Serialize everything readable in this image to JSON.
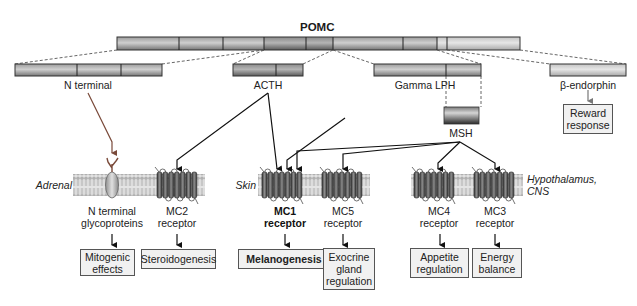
{
  "title": "POMC",
  "colors": {
    "bar_dark": "#6e6e6e",
    "bar_mid": "#9a9a9a",
    "bar_light": "#c9c9c9",
    "arrow_black": "#111111",
    "arrow_brown": "#7a4a3a",
    "membrane": "#c8c8c8",
    "receptor": "#5a5a5a",
    "box_fill": "#f1f1f1"
  },
  "pomc_bar": {
    "x_start": 117,
    "x_end": 520,
    "dividers": [
      179,
      223,
      264,
      306,
      333,
      403,
      437,
      447
    ]
  },
  "fragments": [
    {
      "id": "n-terminal",
      "label": "N terminal"
    },
    {
      "id": "acth",
      "label": "ACTH"
    },
    {
      "id": "gamma-lph",
      "label": "Gamma LPH"
    },
    {
      "id": "beta-endorphin",
      "label": "β-endorphin"
    },
    {
      "id": "msh",
      "label": "MSH"
    }
  ],
  "tissues": [
    {
      "id": "adrenal",
      "label": "Adrenal"
    },
    {
      "id": "skin",
      "label": "Skin"
    },
    {
      "id": "hypothalamus",
      "label": "Hypothalamus, CNS"
    }
  ],
  "receptors": [
    {
      "id": "n-terminal-glyco",
      "label": "N terminal glycoproteins",
      "bold": false
    },
    {
      "id": "mc2",
      "label": "MC2 receptor",
      "bold": false
    },
    {
      "id": "mc1",
      "label": "MC1 receptor",
      "bold": true
    },
    {
      "id": "mc5",
      "label": "MC5 receptor",
      "bold": false
    },
    {
      "id": "mc4",
      "label": "MC4 receptor",
      "bold": false
    },
    {
      "id": "mc3",
      "label": "MC3 receptor",
      "bold": false
    }
  ],
  "effects": [
    {
      "id": "mitogenic",
      "label": "Mitogenic effects"
    },
    {
      "id": "steroidogenesis",
      "label": "Steroidogenesis"
    },
    {
      "id": "melanogenesis",
      "label": "Melanogenesis"
    },
    {
      "id": "exocrine",
      "label": "Exocrine gland regulation"
    },
    {
      "id": "appetite",
      "label": "Appetite regulation"
    },
    {
      "id": "energy",
      "label": "Energy balance"
    },
    {
      "id": "reward",
      "label": "Reward response"
    }
  ]
}
